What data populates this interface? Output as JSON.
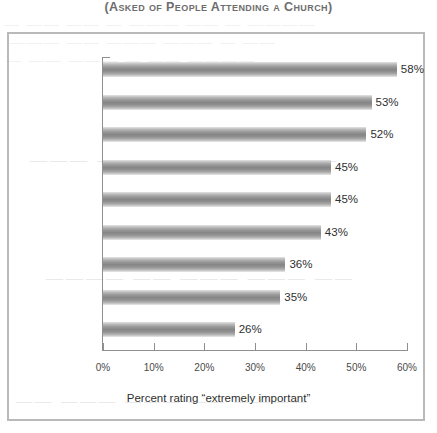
{
  "chart_data": {
    "type": "bar",
    "orientation": "horizontal",
    "title": "(Asked of People Attending a Church)",
    "xlabel": "Percent rating “extremely important”",
    "ylabel": "",
    "xlim": [
      0,
      60
    ],
    "grid": false,
    "legend": null,
    "categories": [
      "Doctrine/\nTheology",
      "People Caring\nfor Each Other",
      "Preaching",
      "Friendliness",
      "Children's\nPrograms",
      "Helping the\nPoor",
      "Denomination",
      "Like the Pastor",
      "Sunday School"
    ],
    "values": [
      58,
      53,
      52,
      45,
      45,
      43,
      36,
      35,
      26
    ],
    "value_labels": [
      "58%",
      "53%",
      "52%",
      "45%",
      "45%",
      "43%",
      "36%",
      "35%",
      "26%"
    ],
    "xticks": [
      0,
      10,
      20,
      30,
      40,
      50,
      60
    ],
    "xtick_labels": [
      "0%",
      "10%",
      "20%",
      "30%",
      "40%",
      "50%",
      "60%"
    ],
    "bars": [
      {
        "label_line1": "Doctrine/",
        "label_line2": "Theology",
        "value": 58,
        "value_label": "58%"
      },
      {
        "label_line1": "People Caring",
        "label_line2": "for Each Other",
        "value": 53,
        "value_label": "53%"
      },
      {
        "label_line1": "Preaching",
        "label_line2": "",
        "value": 52,
        "value_label": "52%"
      },
      {
        "label_line1": "Friendliness",
        "label_line2": "",
        "value": 45,
        "value_label": "45%"
      },
      {
        "label_line1": "Children's",
        "label_line2": "Programs",
        "value": 45,
        "value_label": "45%"
      },
      {
        "label_line1": "Helping the",
        "label_line2": "Poor",
        "value": 43,
        "value_label": "43%"
      },
      {
        "label_line1": "Denomination",
        "label_line2": "",
        "value": 36,
        "value_label": "36%"
      },
      {
        "label_line1": "Like the Pastor",
        "label_line2": "",
        "value": 35,
        "value_label": "35%"
      },
      {
        "label_line1": "Sunday School",
        "label_line2": "",
        "value": 26,
        "value_label": "26%"
      }
    ],
    "colors": {
      "bar_light": "#e4e4e4",
      "bar_dark": "#868686",
      "axis": "#8f8f8f",
      "frame": "#b9b9b9",
      "text": "#2f2f2f",
      "title": "#6d6d6d",
      "background": "#ffffff"
    }
  },
  "bleed_through": {
    "line1": "— —— —— — ——— —— — ————",
    "line2": "——— —— ——— ——— — ——",
    "line3": "— —— ——— — —— ————",
    "line4": "——— —— ———— ——— ——",
    "line5": "———— —— ——— ——— ——",
    "line6": "—— ——— ——— —— ————"
  }
}
